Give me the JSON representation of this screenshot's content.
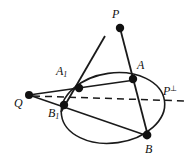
{
  "figure": {
    "background_color": "#ffffff",
    "stroke_color": "#1a1a1a",
    "point_color": "#111111",
    "labels": {
      "p": "P",
      "q": "Q",
      "a": "A",
      "b": "B",
      "a1_base": "A",
      "a1_sub": "1",
      "b1_base": "B",
      "b1_sub": "1",
      "p_perp_base": "P",
      "p_perp_sup": "⊥"
    },
    "points": [
      {
        "name": "P",
        "x": 120,
        "y": 28,
        "r": 4.2,
        "label": "P"
      },
      {
        "name": "Q",
        "x": 29,
        "y": 95,
        "r": 4.0,
        "label": "Q"
      },
      {
        "name": "A",
        "x": 133,
        "y": 79,
        "r": 4.2,
        "label": "A"
      },
      {
        "name": "B",
        "x": 147,
        "y": 135,
        "r": 4.2,
        "label": "B"
      },
      {
        "name": "A1",
        "x": 79,
        "y": 88,
        "r": 4.2,
        "label": "A1"
      },
      {
        "name": "B1",
        "x": 64,
        "y": 105,
        "r": 4.2,
        "label": "B1"
      }
    ],
    "label_positions": [
      {
        "name": "P",
        "x": 112,
        "y": 10
      },
      {
        "name": "Q",
        "x": 15,
        "y": 99
      },
      {
        "name": "A",
        "x": 137,
        "y": 61
      },
      {
        "name": "B",
        "x": 145,
        "y": 144
      },
      {
        "name": "A1",
        "x": 57,
        "y": 67
      },
      {
        "name": "B1",
        "x": 49,
        "y": 108
      },
      {
        "name": "P_perp",
        "x": 163,
        "y": 86
      }
    ],
    "ellipse": {
      "cx": 113,
      "cy": 108,
      "rx": 52,
      "ry": 35,
      "rotation_deg": -8,
      "stroke_width": 1.5
    },
    "segments": [
      {
        "name": "P-A-B",
        "from": "P",
        "to": "B",
        "style": "solid",
        "stroke_width": 1.7
      },
      {
        "name": "P-A1-B1",
        "from": "Pb",
        "to": "B1",
        "style": "solid",
        "stroke_width": 1.7
      },
      {
        "name": "Q-A1-A",
        "from": "Q",
        "to": "A",
        "style": "solid",
        "stroke_width": 1.5
      },
      {
        "name": "Q-B1-B",
        "from": "Q",
        "to": "B",
        "style": "solid",
        "stroke_width": 1.5
      },
      {
        "name": "polar-Pperp",
        "from": "Q",
        "to": "Pperp",
        "style": "dashed",
        "stroke_width": 1.5
      }
    ],
    "dashed_line": {
      "x1": 33,
      "y1": 96,
      "x2": 186,
      "y2": 101,
      "dash": "7 5"
    }
  }
}
